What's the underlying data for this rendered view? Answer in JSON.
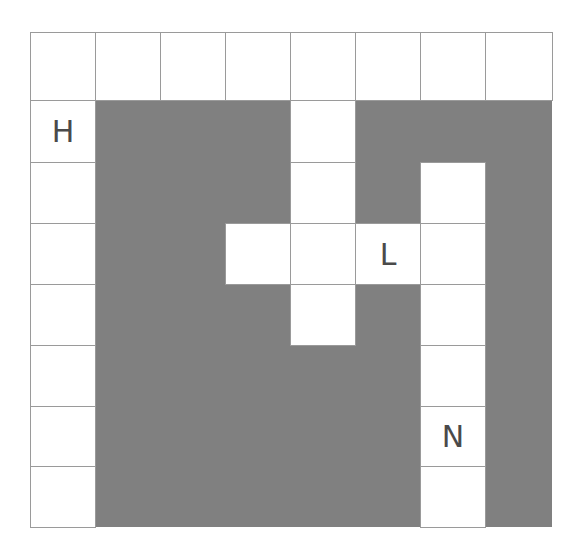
{
  "grid": {
    "rows": 8,
    "cols": 8,
    "fill_color": "#808080",
    "open_color": "#ffffff",
    "line_color": "#9a9a9a",
    "col_edges": [
      0,
      65,
      130,
      195,
      260,
      325,
      390,
      455,
      522
    ],
    "row_edges": [
      0,
      68,
      130,
      191,
      252,
      313,
      374,
      434,
      495
    ],
    "open_cells": [
      [
        0,
        0
      ],
      [
        0,
        1
      ],
      [
        0,
        2
      ],
      [
        0,
        3
      ],
      [
        0,
        4
      ],
      [
        0,
        5
      ],
      [
        0,
        6
      ],
      [
        0,
        7
      ],
      [
        1,
        0
      ],
      [
        2,
        0
      ],
      [
        3,
        0
      ],
      [
        4,
        0
      ],
      [
        5,
        0
      ],
      [
        6,
        0
      ],
      [
        7,
        0
      ],
      [
        1,
        4
      ],
      [
        2,
        4
      ],
      [
        3,
        4
      ],
      [
        4,
        4
      ],
      [
        3,
        3
      ],
      [
        3,
        5
      ],
      [
        3,
        6
      ],
      [
        2,
        6
      ],
      [
        4,
        6
      ],
      [
        5,
        6
      ],
      [
        6,
        6
      ],
      [
        7,
        6
      ]
    ],
    "labels": [
      {
        "row": 1,
        "col": 0,
        "text": "H"
      },
      {
        "row": 3,
        "col": 5,
        "text": "L"
      },
      {
        "row": 6,
        "col": 6,
        "text": "N"
      }
    ]
  }
}
